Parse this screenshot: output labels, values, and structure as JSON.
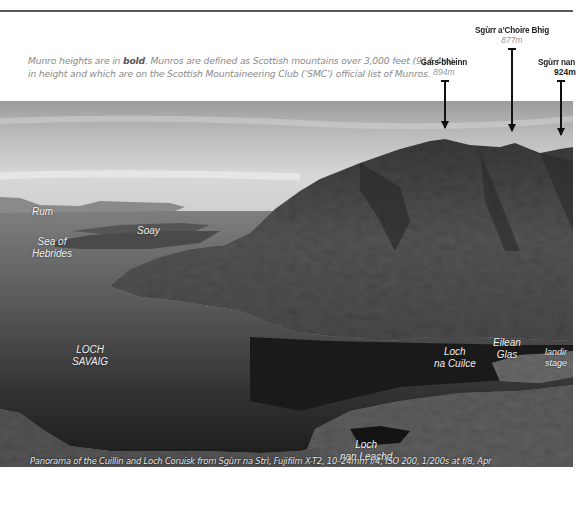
{
  "note": {
    "part1": "Munro heights are in ",
    "bold": "bold",
    "part2": ". Munros are defined as Scottish mountains over 3,000 feet (914.4m)",
    "line2": "in height and which are on the Scottish Mountaineering Club (‘SMC’) official list of Munros."
  },
  "peaks": [
    {
      "name": "Gars-bheinn",
      "height": "894m",
      "munro": false
    },
    {
      "name": "Sgùrr a’Choire Bhig",
      "height": "877m",
      "munro": false
    },
    {
      "name": "Sgùrr nan",
      "height": "924m",
      "munro": true
    }
  ],
  "labels": {
    "rum": "Rum",
    "soay": "Soay",
    "sea_of_hebrides_1": "Sea of",
    "sea_of_hebrides_2": "Hebrides",
    "loch_savaig_1": "LOCH",
    "loch_savaig_2": "SAVAIG",
    "loch_na_cuilce_1": "Loch",
    "loch_na_cuilce_2": "na Cuilce",
    "eilean_glas_1": "Eilean",
    "eilean_glas_2": "Glas",
    "landing_stage_1": "landir",
    "landing_stage_2": "stage",
    "loch_nan_leachd_1": "Loch",
    "loch_nan_leachd_2": "nan Leachd"
  },
  "caption": "Panorama of the Cuillin and Loch Coruisk from Sgùrr na Strì, Fujifilm X-T2, 10–24mm f/4, ISO 200, 1/200s at f/8, Apr",
  "colors": {
    "rule": "#5a5a5a",
    "note_text": "#8a8a8a",
    "peak_text": "#222222",
    "label_text": "#f2f2f2"
  }
}
